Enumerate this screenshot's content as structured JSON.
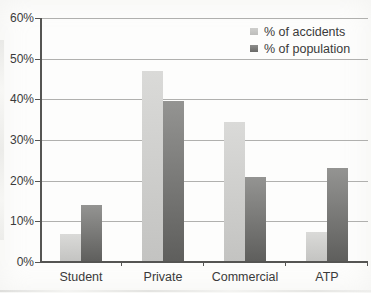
{
  "chart_data": {
    "type": "bar",
    "title": "",
    "xlabel": "",
    "ylabel": "",
    "categories": [
      "Student",
      "Private",
      "Commercial",
      "ATP"
    ],
    "series": [
      {
        "name": "% of accidents",
        "values": [
          7,
          47,
          34.5,
          7.5
        ],
        "color_top": "#dadad8",
        "color_bottom": "#c3c3c1"
      },
      {
        "name": "% of population",
        "values": [
          14,
          39.5,
          21,
          23
        ],
        "color_top": "#949492",
        "color_bottom": "#5e5e5c"
      }
    ],
    "ylim": [
      0,
      60
    ],
    "ytick_step": 10,
    "ytick_labels": [
      "0%",
      "10%",
      "20%",
      "30%",
      "40%",
      "50%",
      "60%"
    ],
    "grid": true,
    "legend_position": "top-right",
    "axis_color": "#555553",
    "gridline_color": "#b0b0ae",
    "text_color": "#3a3a3a",
    "background_color": "#fdfdfc"
  }
}
